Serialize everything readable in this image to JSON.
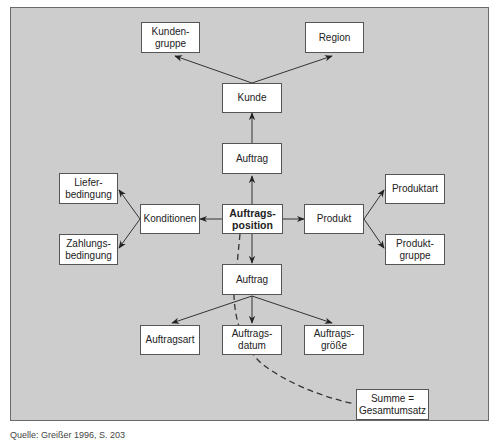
{
  "diagram": {
    "type": "star-schema",
    "center": "Auftrags-\nposition",
    "nodes": {
      "kundengruppe": "Kunden-\ngruppe",
      "region": "Region",
      "kunde": "Kunde",
      "auftrag_top": "Auftrag",
      "lieferbedingung": "Liefer-\nbedingung",
      "zahlungsbedingung": "Zahlungs-\nbedingung",
      "konditionen": "Konditionen",
      "auftragsposition": "Auftrags-\nposition",
      "produkt": "Produkt",
      "produktart": "Produktart",
      "produktgruppe": "Produkt-\ngruppe",
      "auftrag_bottom": "Auftrag",
      "auftragsart": "Auftragsart",
      "auftragsdatum": "Auftrags-\ndatum",
      "auftragsgroesse": "Auftrags-\ngröße",
      "summe": "Summe =\nGesamtumsatz"
    },
    "edges": [
      {
        "from": "Auftrags-position",
        "to": "Auftrag (oben)"
      },
      {
        "from": "Auftrag (oben)",
        "to": "Kunde"
      },
      {
        "from": "Kunde",
        "to": "Kunden-gruppe"
      },
      {
        "from": "Kunde",
        "to": "Region"
      },
      {
        "from": "Auftrags-position",
        "to": "Konditionen"
      },
      {
        "from": "Konditionen",
        "to": "Liefer-bedingung"
      },
      {
        "from": "Konditionen",
        "to": "Zahlungs-bedingung"
      },
      {
        "from": "Auftrags-position",
        "to": "Produkt"
      },
      {
        "from": "Produkt",
        "to": "Produktart"
      },
      {
        "from": "Produkt",
        "to": "Produkt-gruppe"
      },
      {
        "from": "Auftrags-position",
        "to": "Auftrag (unten)"
      },
      {
        "from": "Auftrag (unten)",
        "to": "Auftragsart"
      },
      {
        "from": "Auftrag (unten)",
        "to": "Auftrags-datum"
      },
      {
        "from": "Auftrag (unten)",
        "to": "Auftrags-größe"
      },
      {
        "from": "Auftrags-position",
        "to": "Summe = Gesamtumsatz",
        "style": "dashed"
      }
    ]
  },
  "caption": "Quelle: Greißer 1996, S. 203",
  "colors": {
    "panel_bg": "#cdcdcd",
    "node_bg": "#ffffff",
    "line": "#333333"
  }
}
